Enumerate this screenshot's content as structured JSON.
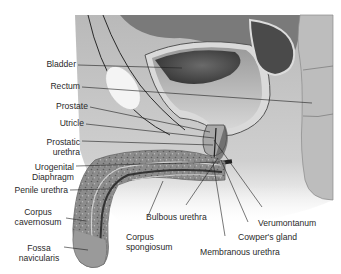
{
  "figure": {
    "labels": {
      "bladder": "Bladder",
      "rectum": "Rectum",
      "prostate": "Prostate",
      "utricle": "Utricle",
      "prostatic_urethra_1": "Prostatic",
      "prostatic_urethra_2": "urethra",
      "urogenital_1": "Urogenital",
      "urogenital_2": "Diaphragm",
      "penile_urethra": "Penile urethra",
      "corpus_cav_1": "Corpus",
      "corpus_cav_2": "cavernosum",
      "fossa_1": "Fossa",
      "fossa_2": "navicularis",
      "bulbous_urethra": "Bulbous urethra",
      "corpus_spong_1": "Corpus",
      "corpus_spong_2": "spongiosum",
      "verumontanum": "Verumontanum",
      "cowpers_gland": "Cowper's gland",
      "membranous_urethra": "Membranous urethra"
    },
    "colors": {
      "background": "#ffffff",
      "tissue_light": "#c9c9c9",
      "tissue_mid": "#a8a8a8",
      "bladder_dark": "#3c3c3c",
      "leader_line": "#1e1e1e",
      "label_text": "#2a2a2a"
    }
  }
}
